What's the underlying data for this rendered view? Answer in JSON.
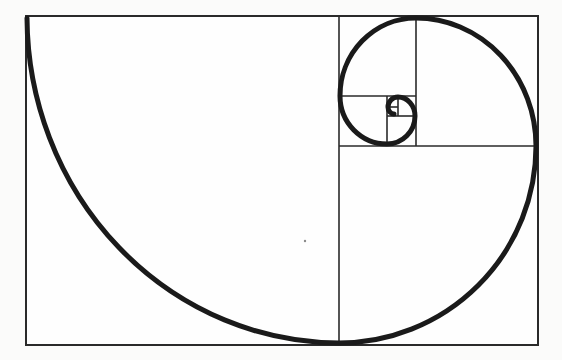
{
  "diagram": {
    "title": "Golden spiral",
    "colors": {
      "background": "#fbfbfa",
      "line": "#2a2a2a",
      "spiral": "#1a1a1a"
    },
    "outer_rect": {
      "x": 26,
      "y": 16,
      "width": 512,
      "height": 329
    },
    "squares": [
      {
        "name": "square-1",
        "x": 26,
        "y": 16,
        "width": 313,
        "height": 329
      },
      {
        "name": "square-2",
        "x": 339,
        "y": 146,
        "width": 199,
        "height": 199
      },
      {
        "name": "square-3",
        "x": 416,
        "y": 16,
        "width": 122,
        "height": 130
      },
      {
        "name": "square-4",
        "x": 339,
        "y": 16,
        "width": 77,
        "height": 80
      },
      {
        "name": "square-5",
        "x": 339,
        "y": 96,
        "width": 48,
        "height": 50
      },
      {
        "name": "square-6",
        "x": 387,
        "y": 116,
        "width": 29,
        "height": 30
      },
      {
        "name": "square-7",
        "x": 398,
        "y": 96,
        "width": 18,
        "height": 20
      },
      {
        "name": "square-8",
        "x": 387,
        "y": 96,
        "width": 11,
        "height": 11
      }
    ],
    "divider_lines": [
      {
        "name": "divider-v1",
        "x1": 339,
        "y1": 16,
        "x2": 339,
        "y2": 345
      },
      {
        "name": "divider-h1",
        "x1": 339,
        "y1": 146,
        "x2": 538,
        "y2": 146
      },
      {
        "name": "divider-v2",
        "x1": 416,
        "y1": 16,
        "x2": 416,
        "y2": 146
      },
      {
        "name": "divider-h2",
        "x1": 339,
        "y1": 96,
        "x2": 416,
        "y2": 96
      },
      {
        "name": "divider-v3",
        "x1": 387,
        "y1": 96,
        "x2": 387,
        "y2": 146
      },
      {
        "name": "divider-h3",
        "x1": 387,
        "y1": 116,
        "x2": 416,
        "y2": 116
      },
      {
        "name": "divider-v4",
        "x1": 398,
        "y1": 96,
        "x2": 398,
        "y2": 116
      },
      {
        "name": "divider-h4",
        "x1": 387,
        "y1": 107,
        "x2": 398,
        "y2": 107
      }
    ],
    "spiral_path": "M 27 18 A 313 327 0 0 0 339 343 A 197 197 0 0 0 536 146 A 120 128 0 0 0 416 18 A 76 78 0 0 0 340 96 A 47 48 0 0 0 387 144 A 28 28 0 0 0 415 116 A 17 19 0 0 0 398 97 A 10 10 0 0 0 388 107 A 6 7 0 0 0 394 114"
  }
}
